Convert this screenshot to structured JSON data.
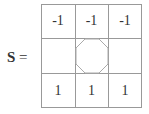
{
  "matrix_label": "S",
  "equals": "=",
  "cells": [
    [
      "-1",
      "-1",
      "-1"
    ],
    [
      "",
      "octagon",
      ""
    ],
    [
      "1",
      "1",
      "1"
    ]
  ],
  "center_symbol": "octagon-icon",
  "line_color": "#999999",
  "octagon_color": "#aaaaaa"
}
